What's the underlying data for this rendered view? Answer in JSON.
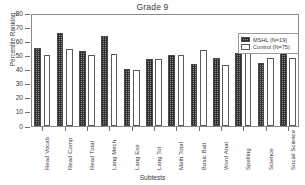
{
  "chart_data": {
    "type": "bar",
    "title": "Grade 9",
    "xlabel": "Subtests",
    "ylabel": "Percentile Ranking",
    "ylim": [
      0,
      80
    ],
    "yticks": [
      0,
      10,
      20,
      30,
      40,
      50,
      60,
      70,
      80
    ],
    "grid": false,
    "legend_position": "top-right",
    "categories": [
      "Read Vocab",
      "Read Comp",
      "Read Total",
      "Lang Mech",
      "Lang Exp",
      "Lang Tot",
      "Math Total",
      "Basic Batt",
      "Word Anal",
      "Spelling",
      "Science",
      "Social Science"
    ],
    "series": [
      {
        "name": "MSHL (N=19)",
        "color": "#8d8d8d",
        "values": [
          55,
          66,
          53,
          63.5,
          40.5,
          47.5,
          50.5,
          44,
          48,
          52,
          44.5,
          55.5
        ]
      },
      {
        "name": "Control (N=75)",
        "color": "#ffffff",
        "values": [
          50.5,
          54.5,
          50,
          51,
          40,
          47.5,
          50.5,
          53.5,
          43.5,
          52,
          48,
          48
        ]
      }
    ]
  },
  "legend": {
    "entries": [
      {
        "label": "MSHL (N=19)"
      },
      {
        "label": "Control (N=75)"
      }
    ]
  }
}
